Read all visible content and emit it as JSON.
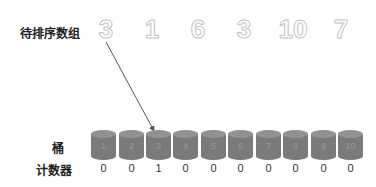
{
  "labels": {
    "array": "待排序数组",
    "bucket": "桶",
    "counter": "计数器"
  },
  "array": [
    "3",
    "1",
    "6",
    "3",
    "10",
    "7"
  ],
  "buckets": [
    "1",
    "2",
    "3",
    "4",
    "5",
    "6",
    "7",
    "8",
    "9",
    "10"
  ],
  "counts": [
    "0",
    "0",
    "1",
    "0",
    "0",
    "0",
    "0",
    "0",
    "0",
    "0"
  ],
  "colors": {
    "bucket_body": "#7a7a7a",
    "bucket_top": "#909090",
    "array_digit_outline": "#c4c4c4",
    "arrow": "#555555"
  },
  "arrow": {
    "from_index": 0,
    "to_bucket": "3"
  }
}
